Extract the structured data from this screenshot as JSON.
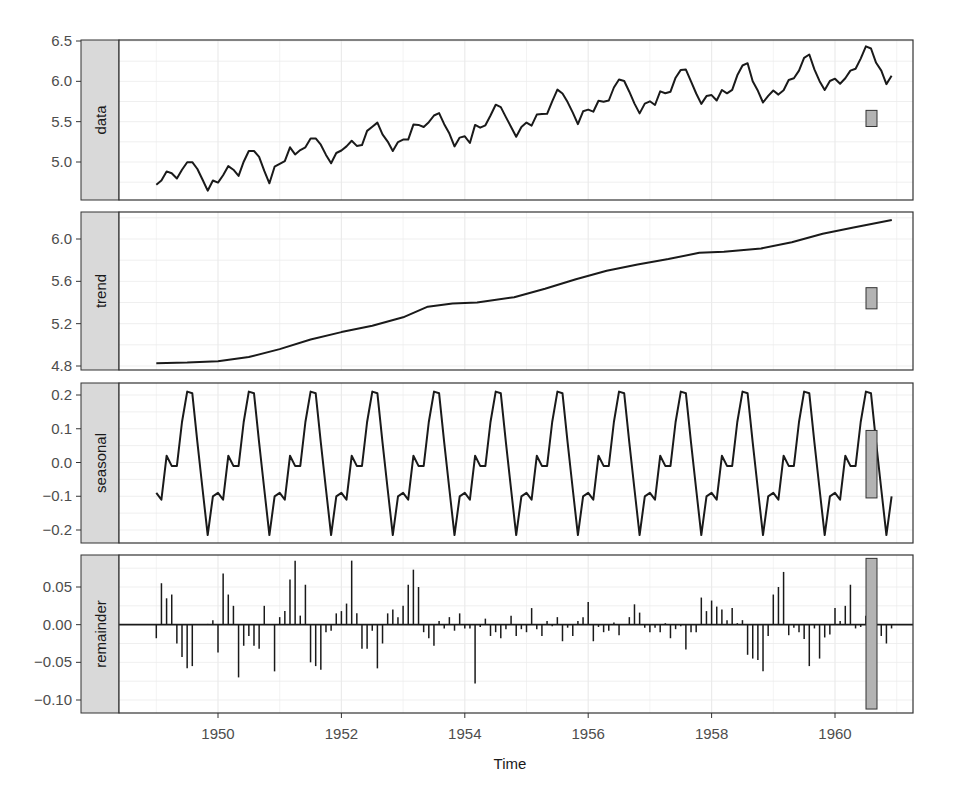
{
  "chart_data": {
    "type": "line",
    "title": "",
    "xlabel": "Time",
    "ylabel": "",
    "x_ticks": [
      "1950",
      "1952",
      "1954",
      "1956",
      "1958",
      "1960"
    ],
    "x_range": [
      1948.5,
      1961.8
    ],
    "start": 1949.0,
    "frequency": 12,
    "grid": true,
    "legend": "none",
    "panels": [
      {
        "name": "data",
        "type": "line",
        "y_ticks": [
          "5.0",
          "5.5",
          "6.0",
          "6.5"
        ],
        "y_tick_values": [
          5.0,
          5.5,
          6.0,
          6.5
        ],
        "ylim": [
          4.62,
          6.55
        ],
        "scale_bar": {
          "ymid": 5.54,
          "half": 0.1
        },
        "values": [
          4.718,
          4.771,
          4.883,
          4.86,
          4.796,
          4.905,
          4.997,
          4.997,
          4.913,
          4.779,
          4.644,
          4.771,
          4.745,
          4.836,
          4.949,
          4.905,
          4.828,
          5.004,
          5.136,
          5.136,
          5.063,
          4.89,
          4.736,
          4.942,
          4.977,
          5.011,
          5.182,
          5.094,
          5.147,
          5.182,
          5.293,
          5.293,
          5.215,
          5.088,
          4.984,
          5.112,
          5.142,
          5.193,
          5.263,
          5.199,
          5.209,
          5.385,
          5.438,
          5.489,
          5.342,
          5.253,
          5.136,
          5.247,
          5.278,
          5.278,
          5.464,
          5.46,
          5.434,
          5.493,
          5.576,
          5.606,
          5.468,
          5.352,
          5.193,
          5.303,
          5.318,
          5.236,
          5.46,
          5.425,
          5.455,
          5.576,
          5.71,
          5.68,
          5.557,
          5.434,
          5.313,
          5.434,
          5.489,
          5.451,
          5.587,
          5.595,
          5.598,
          5.753,
          5.897,
          5.849,
          5.743,
          5.613,
          5.468,
          5.628,
          5.649,
          5.624,
          5.759,
          5.746,
          5.762,
          5.924,
          6.023,
          6.004,
          5.872,
          5.724,
          5.602,
          5.724,
          5.753,
          5.707,
          5.875,
          5.852,
          5.872,
          6.045,
          6.142,
          6.146,
          6.001,
          5.849,
          5.72,
          5.817,
          5.829,
          5.762,
          5.892,
          5.852,
          5.894,
          6.075,
          6.196,
          6.225,
          6.001,
          5.883,
          5.737,
          5.82,
          5.886,
          5.835,
          5.889,
          6.017,
          6.038,
          6.133,
          6.292,
          6.333,
          6.148,
          6.002,
          5.892,
          6.004,
          6.033,
          5.969,
          6.038,
          6.133,
          6.157,
          6.282,
          6.433,
          6.407,
          6.23,
          6.133,
          5.966,
          6.068
        ]
      },
      {
        "name": "trend",
        "type": "line",
        "y_ticks": [
          "4.8",
          "5.2",
          "5.6",
          "6.0"
        ],
        "y_tick_values": [
          4.8,
          5.2,
          5.6,
          6.0
        ],
        "ylim": [
          4.78,
          6.25
        ],
        "scale_bar": {
          "ymid": 5.44,
          "half": 0.1
        },
        "keypoints": [
          [
            1949.0,
            4.826
          ],
          [
            1949.5,
            4.832
          ],
          [
            1950.0,
            4.845
          ],
          [
            1950.5,
            4.885
          ],
          [
            1951.0,
            4.96
          ],
          [
            1951.5,
            5.05
          ],
          [
            1952.0,
            5.12
          ],
          [
            1952.5,
            5.18
          ],
          [
            1953.0,
            5.26
          ],
          [
            1953.4,
            5.36
          ],
          [
            1953.8,
            5.39
          ],
          [
            1954.2,
            5.4
          ],
          [
            1954.8,
            5.45
          ],
          [
            1955.3,
            5.53
          ],
          [
            1955.8,
            5.62
          ],
          [
            1956.3,
            5.7
          ],
          [
            1956.8,
            5.76
          ],
          [
            1957.3,
            5.81
          ],
          [
            1957.8,
            5.87
          ],
          [
            1958.2,
            5.88
          ],
          [
            1958.8,
            5.91
          ],
          [
            1959.3,
            5.97
          ],
          [
            1959.8,
            6.05
          ],
          [
            1960.3,
            6.11
          ],
          [
            1960.92,
            6.18
          ]
        ]
      },
      {
        "name": "seasonal",
        "type": "line",
        "y_ticks": [
          "-0.2",
          "-0.1",
          "0.0",
          "0.1",
          "0.2"
        ],
        "y_tick_values": [
          -0.2,
          -0.1,
          0.0,
          0.1,
          0.2
        ],
        "ylim": [
          -0.235,
          0.235
        ],
        "scale_bar": {
          "ymid": -0.005,
          "half": 0.1
        },
        "pattern_months": [
          "Jan",
          "Feb",
          "Mar",
          "Apr",
          "May",
          "Jun",
          "Jul",
          "Aug",
          "Sep",
          "Oct",
          "Nov",
          "Dec"
        ],
        "pattern_values": [
          -0.09,
          -0.11,
          0.02,
          -0.01,
          -0.01,
          0.12,
          0.21,
          0.205,
          0.06,
          -0.08,
          -0.215,
          -0.1
        ],
        "values_note": "pattern repeats each year 1949-1960"
      },
      {
        "name": "remainder",
        "type": "bar",
        "y_ticks": [
          "-0.10",
          "-0.05",
          "0.00",
          "0.05"
        ],
        "y_tick_values": [
          -0.1,
          -0.05,
          0.0,
          0.05
        ],
        "ylim": [
          -0.113,
          0.09
        ],
        "scale_bar": {
          "ymid": -0.012,
          "half": 0.1
        },
        "values": [
          -0.018,
          0.055,
          0.035,
          0.04,
          -0.025,
          -0.043,
          -0.058,
          -0.055,
          0.0,
          0.0,
          0.001,
          0.006,
          -0.037,
          0.068,
          0.04,
          0.025,
          -0.07,
          -0.028,
          -0.015,
          -0.028,
          -0.032,
          0.025,
          0.0,
          -0.062,
          0.01,
          0.018,
          0.06,
          0.085,
          0.012,
          0.053,
          -0.05,
          -0.055,
          -0.06,
          -0.01,
          -0.008,
          0.015,
          0.018,
          0.028,
          0.085,
          0.015,
          -0.032,
          -0.032,
          -0.008,
          -0.058,
          -0.025,
          0.015,
          0.02,
          0.01,
          0.025,
          0.053,
          0.073,
          0.05,
          -0.01,
          -0.018,
          -0.028,
          0.005,
          -0.005,
          0.01,
          -0.008,
          0.015,
          -0.005,
          -0.005,
          -0.078,
          -0.003,
          0.008,
          -0.015,
          -0.01,
          -0.018,
          -0.006,
          0.012,
          -0.015,
          -0.006,
          -0.01,
          0.022,
          -0.006,
          -0.015,
          0.005,
          -0.002,
          0.01,
          -0.022,
          -0.004,
          -0.015,
          0.005,
          0.01,
          0.03,
          -0.022,
          -0.003,
          -0.01,
          -0.008,
          0.003,
          -0.014,
          0.0,
          0.01,
          0.027,
          0.016,
          -0.004,
          -0.01,
          -0.004,
          -0.01,
          0.002,
          -0.018,
          -0.006,
          -0.002,
          -0.033,
          -0.01,
          -0.01,
          0.036,
          0.018,
          0.032,
          0.024,
          0.02,
          0.006,
          0.022,
          0.002,
          0.006,
          -0.04,
          -0.045,
          -0.047,
          -0.062,
          -0.015,
          0.04,
          0.05,
          0.07,
          -0.014,
          -0.004,
          -0.01,
          -0.019,
          -0.055,
          -0.005,
          -0.045,
          -0.017,
          -0.013,
          0.022,
          0.005,
          0.025,
          0.053,
          -0.005,
          -0.003,
          0.012,
          0.004,
          0.01,
          -0.015,
          -0.025,
          -0.005
        ]
      }
    ]
  },
  "labels": {
    "strip_data": "data",
    "strip_trend": "trend",
    "strip_seasonal": "seasonal",
    "strip_remainder": "remainder",
    "x_axis_title": "Time"
  },
  "colors": {
    "line": "#1a1a1a",
    "strip_fill": "#d9d9d9",
    "scale_bar_fill": "#b3b3b3",
    "grid": "#ebebeb",
    "panel_border": "#333333",
    "tick_text": "#4d4d4d"
  }
}
